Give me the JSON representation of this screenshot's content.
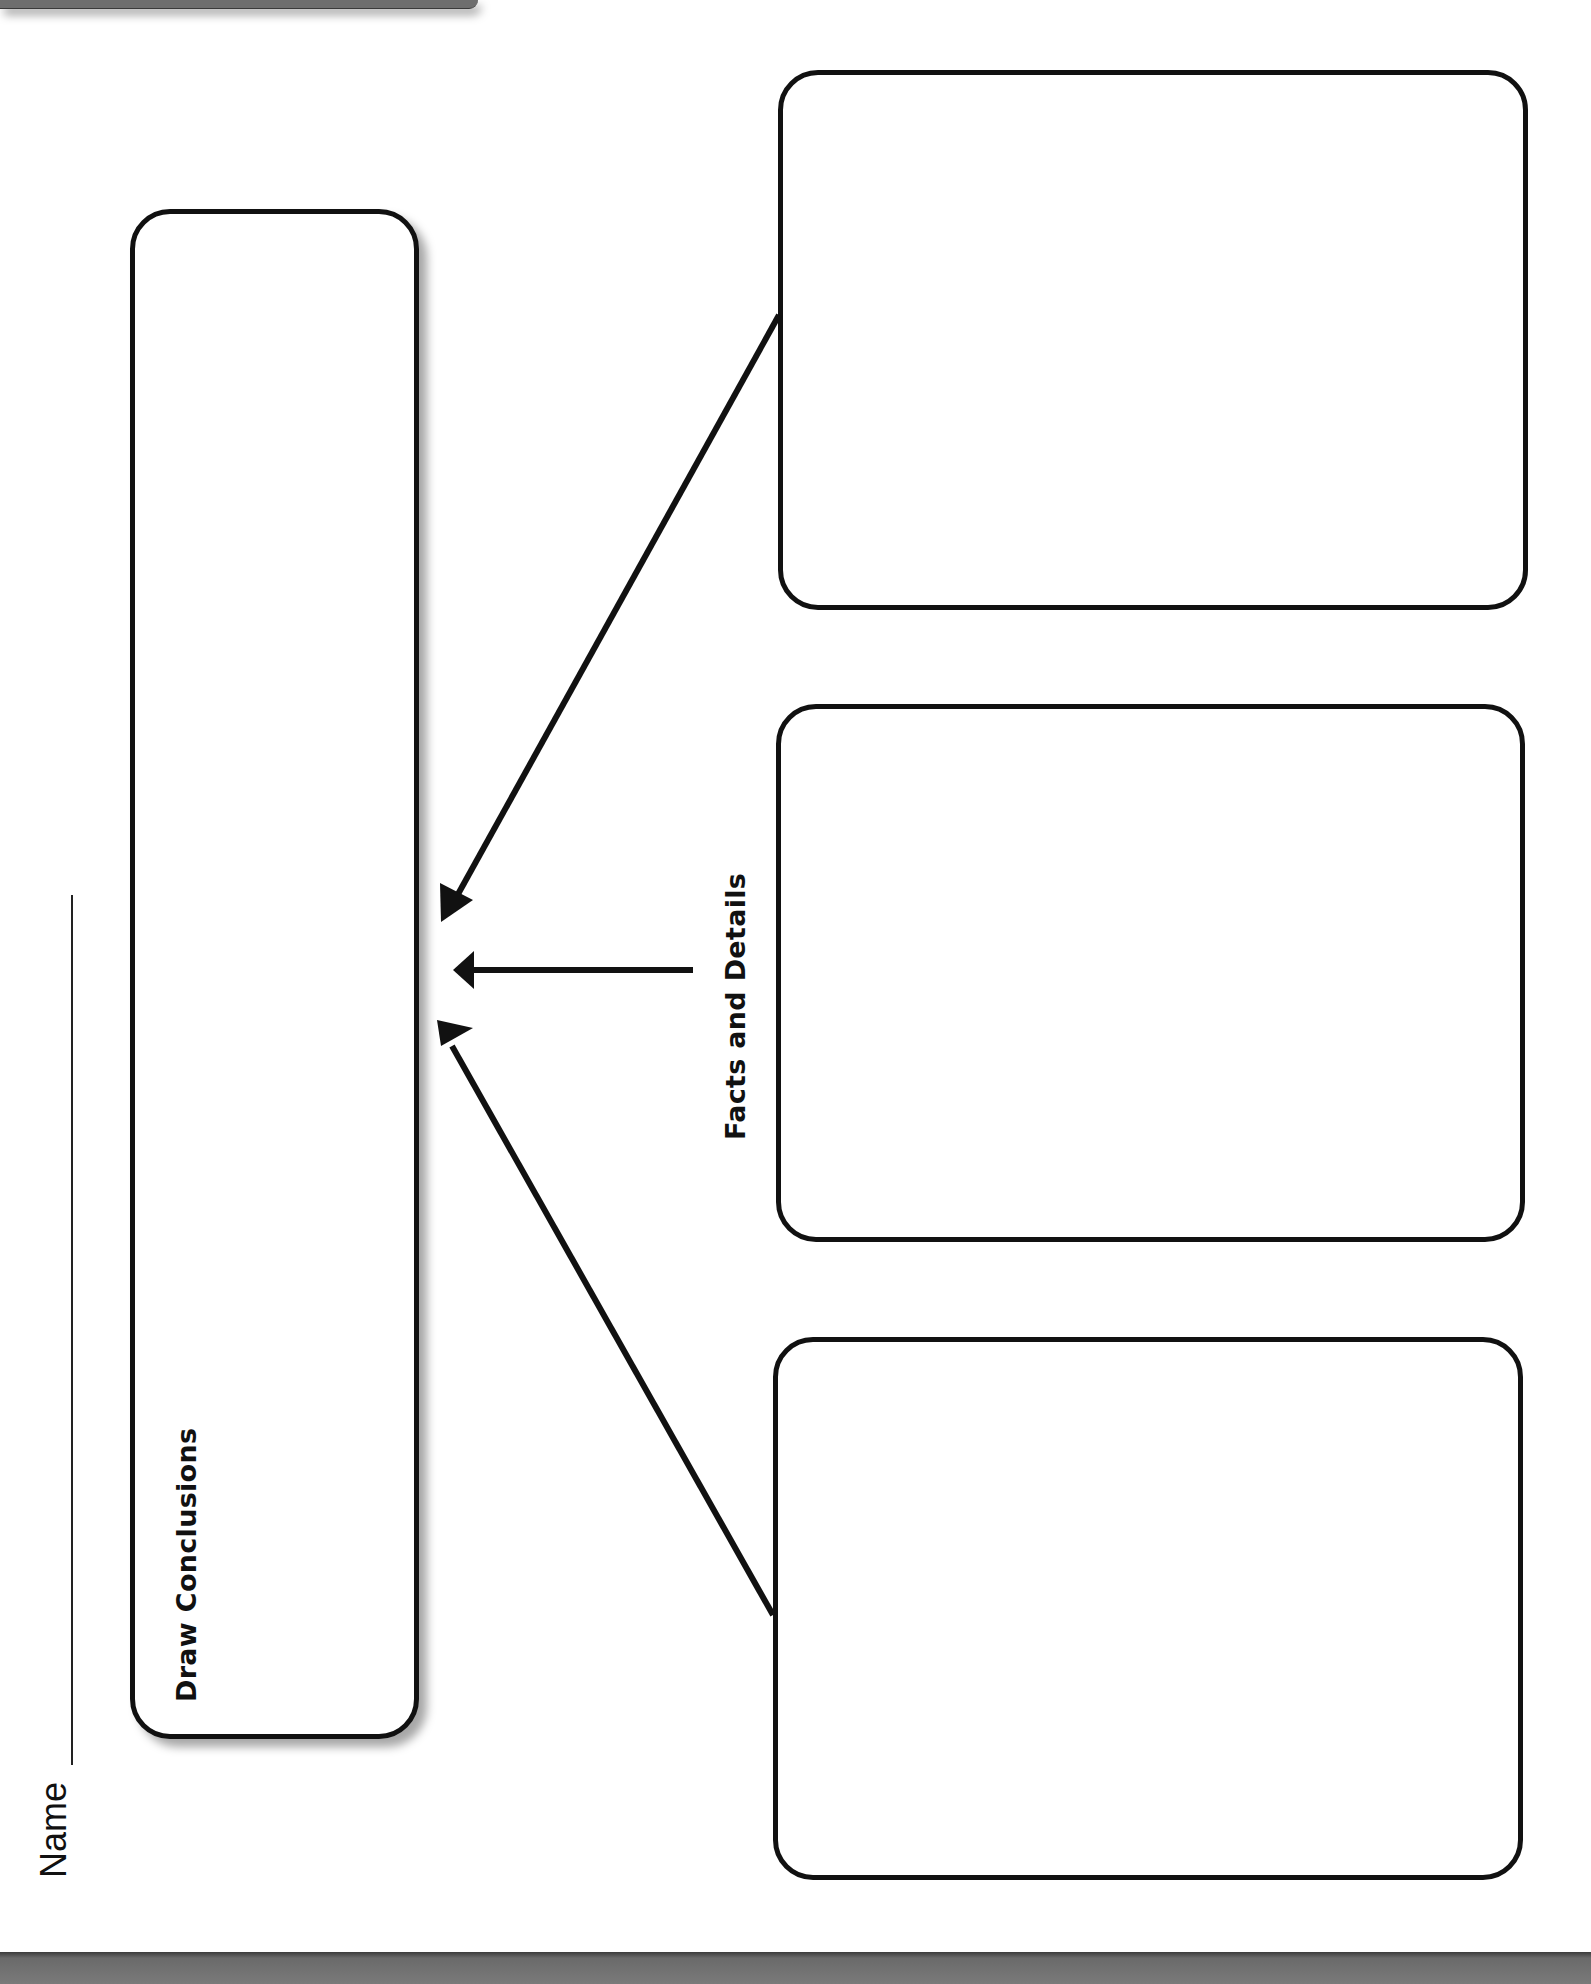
{
  "header": {
    "tab_text": ""
  },
  "name_field": {
    "label": "Name",
    "value": ""
  },
  "organizer": {
    "title": "Draw Conclusions",
    "conclusion_box": {
      "label": "Draw Conclusions",
      "value": ""
    },
    "facts_label": "Facts and Details",
    "fact_boxes": [
      {
        "value": ""
      },
      {
        "value": ""
      },
      {
        "value": ""
      }
    ],
    "arrows": [
      {
        "from": "fact-box-1",
        "to": "conclusion-box"
      },
      {
        "from": "facts-label",
        "to": "conclusion-box"
      },
      {
        "from": "fact-box-3",
        "to": "conclusion-box"
      }
    ]
  },
  "colors": {
    "ink": "#111111",
    "page": "#ffffff",
    "tab_gray": "#6e6e6e",
    "bar_gray": "#6a6a6a"
  }
}
